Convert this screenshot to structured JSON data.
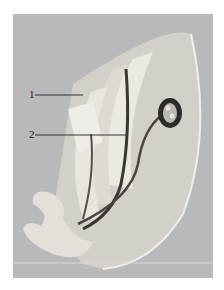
{
  "figure": {
    "labels": [
      {
        "id": "1",
        "text": "1"
      },
      {
        "id": "2",
        "text": "2"
      }
    ],
    "colors": {
      "background": "#b9b9b9",
      "model_light": "#e6e3dd",
      "model_shade": "#cfcac2",
      "tube_dark": "#3a3633",
      "label_line": "#333333"
    }
  }
}
